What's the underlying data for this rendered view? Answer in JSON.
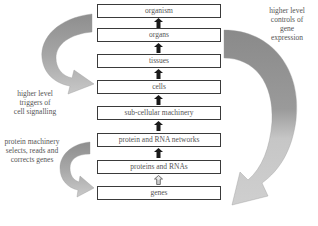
{
  "diagram": {
    "levels": [
      {
        "label": "organism",
        "top": 4
      },
      {
        "label": "organs",
        "top": 28
      },
      {
        "label": "tissues",
        "top": 54
      },
      {
        "label": "cells",
        "top": 80
      },
      {
        "label": "sub-cellular machinery",
        "top": 106
      },
      {
        "label": "protein and RNA networks",
        "top": 133
      },
      {
        "label": "proteins and RNAs",
        "top": 160
      },
      {
        "label": "genes",
        "top": 186
      }
    ],
    "connectors": [
      {
        "from": "organs",
        "to": "organism",
        "style": "solid"
      },
      {
        "from": "tissues",
        "to": "organs",
        "style": "solid"
      },
      {
        "from": "cells",
        "to": "tissues",
        "style": "solid"
      },
      {
        "from": "sub-cellular machinery",
        "to": "cells",
        "style": "solid"
      },
      {
        "from": "protein and RNA networks",
        "to": "sub-cellular machinery",
        "style": "solid"
      },
      {
        "from": "proteins and RNAs",
        "to": "protein and RNA networks",
        "style": "solid"
      },
      {
        "from": "genes",
        "to": "proteins and RNAs",
        "style": "outlined"
      }
    ],
    "annotations": {
      "right_top": "higher level controls of gene expression",
      "right_top_lines": [
        "higher level",
        "controls of",
        "gene",
        "expression"
      ],
      "left_middle": "higher level triggers of cell signalling",
      "left_middle_lines": [
        "higher level",
        "triggers of",
        "cell signalling"
      ],
      "left_bottom": "protein machinery selects, reads and corrects genes",
      "left_bottom_lines": [
        "protein machinery",
        "selects, reads and",
        "corrects genes"
      ]
    },
    "colors": {
      "arrow_dark": "#8c8c8c",
      "arrow_light": "#c4c4c4",
      "box_border": "#3a3a3a",
      "up_arrow": "#1a1a1a"
    }
  }
}
